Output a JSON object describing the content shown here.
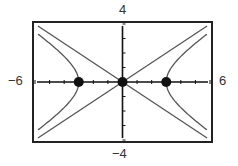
{
  "chart_data": {
    "type": "line",
    "title": "",
    "xlabel": "",
    "ylabel": "",
    "xlim": [
      -6,
      6
    ],
    "ylim": [
      -4,
      4
    ],
    "tick_labels": {
      "xmin": "−6",
      "xmax": "6",
      "ymin": "−4",
      "ymax": "4"
    },
    "x_ticks": [
      -6,
      -5,
      -4,
      -3,
      -2,
      -1,
      0,
      1,
      2,
      3,
      4,
      5,
      6
    ],
    "y_ticks": [
      -4,
      -3,
      -2,
      -1,
      0,
      1,
      2,
      3,
      4
    ],
    "series": [
      {
        "name": "hyperbola",
        "equation": "x^2/9 - y^2/4 = 1"
      },
      {
        "name": "asymptote 1",
        "equation": "y = 2x/3"
      },
      {
        "name": "asymptote 2",
        "equation": "y = -2x/3"
      }
    ],
    "points": [
      {
        "x": -3,
        "y": 0
      },
      {
        "x": 0,
        "y": 0
      },
      {
        "x": 3,
        "y": 0
      }
    ],
    "grid": false,
    "legend": "none"
  }
}
